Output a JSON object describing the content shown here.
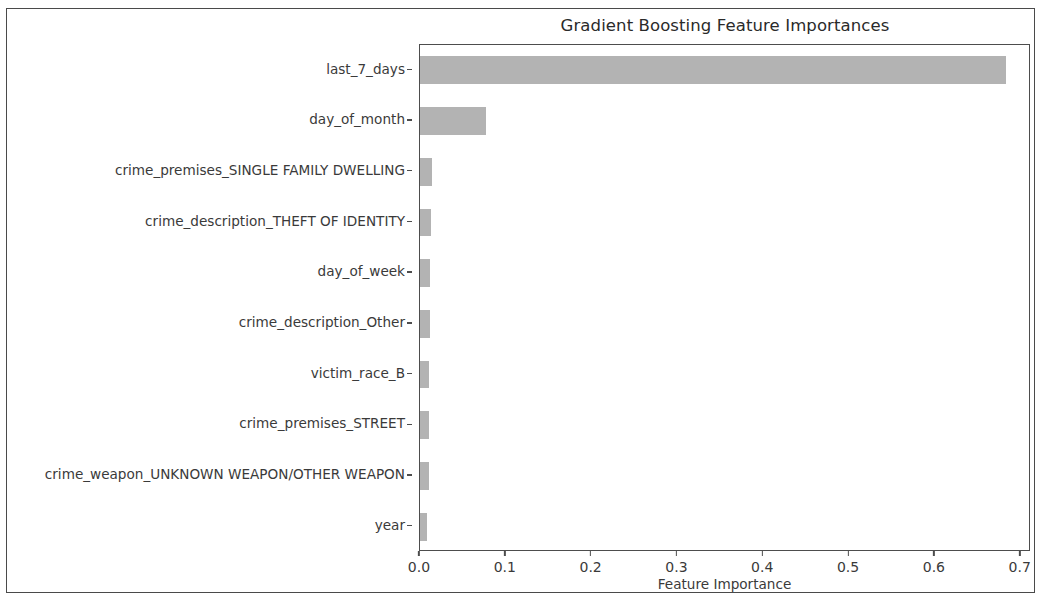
{
  "figure": {
    "background_color": "#ffffff",
    "frame_color": "#4a4a4a"
  },
  "chart_data": {
    "type": "bar",
    "orientation": "horizontal",
    "title": "Gradient Boosting Feature Importances",
    "xlabel": "Feature Importance",
    "ylabel": "",
    "categories": [
      "last_7_days",
      "day_of_month",
      "crime_premises_SINGLE FAMILY DWELLING",
      "crime_description_THEFT OF IDENTITY",
      "day_of_week",
      "crime_description_Other",
      "victim_race_B",
      "crime_premises_STREET",
      "crime_weapon_UNKNOWN WEAPON/OTHER WEAPON",
      "year"
    ],
    "values": [
      0.683,
      0.077,
      0.014,
      0.013,
      0.012,
      0.012,
      0.011,
      0.011,
      0.01,
      0.008
    ],
    "xlim": [
      0.0,
      0.712
    ],
    "ylim_note": "categorical, 10 bars, highest importance at top",
    "xticks": [
      0.0,
      0.1,
      0.2,
      0.3,
      0.4,
      0.5,
      0.6,
      0.7
    ],
    "xticklabels": [
      "0.0",
      "0.1",
      "0.2",
      "0.3",
      "0.4",
      "0.5",
      "0.6",
      "0.7"
    ],
    "bar_color": "#b3b3b3",
    "grid": false,
    "legend": null
  }
}
